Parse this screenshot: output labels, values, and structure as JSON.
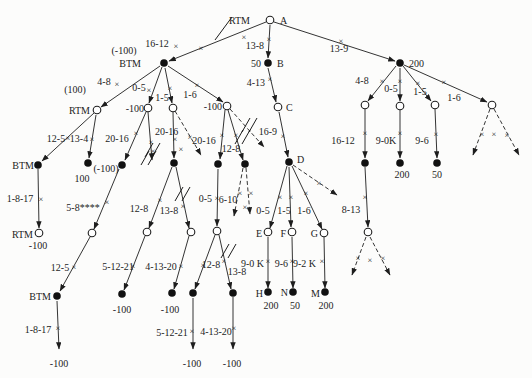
{
  "figure": {
    "name": "game-tree-search-diagram",
    "canvas": {
      "w": 532,
      "h": 378,
      "bg": "#fcfcfb",
      "ink": "#1d1d1d"
    },
    "nodes": [
      {
        "n": "A",
        "k": "o",
        "x": 270,
        "y": 20
      },
      {
        "n": "B",
        "k": "f",
        "x": 268,
        "y": 63
      },
      {
        "n": "C",
        "k": "o",
        "x": 278,
        "y": 107
      },
      {
        "n": "D",
        "k": "f",
        "x": 289,
        "y": 162
      },
      {
        "n": "BTM-1",
        "k": "f",
        "x": 164,
        "y": 63
      },
      {
        "n": "RTM-1",
        "k": "o",
        "x": 97,
        "y": 110
      },
      {
        "n": "open-148",
        "k": "o",
        "x": 148,
        "y": 108
      },
      {
        "n": "open-173",
        "k": "o",
        "x": 173,
        "y": 108
      },
      {
        "n": "open-227",
        "k": "o",
        "x": 227,
        "y": 106
      },
      {
        "n": "node-200",
        "k": "f",
        "x": 400,
        "y": 63
      },
      {
        "n": "r-open-1",
        "k": "o",
        "x": 365,
        "y": 105
      },
      {
        "n": "r-open-2",
        "k": "o",
        "x": 400,
        "y": 106
      },
      {
        "n": "r-open-3",
        "k": "o",
        "x": 435,
        "y": 105
      },
      {
        "n": "r-open-4",
        "k": "o",
        "x": 492,
        "y": 105
      },
      {
        "n": "BTM-2",
        "k": "f",
        "x": 38,
        "y": 165
      },
      {
        "n": "leaf-100",
        "k": "f",
        "x": 88,
        "y": 163
      },
      {
        "n": "mid-neg100",
        "k": "f",
        "x": 122,
        "y": 165
      },
      {
        "n": "mid-174",
        "k": "f",
        "x": 174,
        "y": 163
      },
      {
        "n": "mid-218",
        "k": "f",
        "x": 218,
        "y": 164
      },
      {
        "n": "mid-245",
        "k": "f",
        "x": 245,
        "y": 164
      },
      {
        "n": "r-fill-1",
        "k": "f",
        "x": 365,
        "y": 163
      },
      {
        "n": "r-fill-200",
        "k": "f",
        "x": 400,
        "y": 163
      },
      {
        "n": "r-fill-50",
        "k": "f",
        "x": 437,
        "y": 163
      },
      {
        "n": "RTM-2",
        "k": "o",
        "x": 39,
        "y": 233
      },
      {
        "n": "open-92",
        "k": "o",
        "x": 92,
        "y": 233
      },
      {
        "n": "open-147",
        "k": "o",
        "x": 147,
        "y": 232
      },
      {
        "n": "open-190",
        "k": "o",
        "x": 191,
        "y": 232
      },
      {
        "n": "open-217",
        "k": "o",
        "x": 217,
        "y": 231
      },
      {
        "n": "E",
        "k": "o",
        "x": 268,
        "y": 232
      },
      {
        "n": "F",
        "k": "o",
        "x": 292,
        "y": 232
      },
      {
        "n": "G",
        "k": "o",
        "x": 324,
        "y": 233
      },
      {
        "n": "open-368",
        "k": "o",
        "x": 368,
        "y": 232
      },
      {
        "n": "BTM-3",
        "k": "f",
        "x": 57,
        "y": 296
      },
      {
        "n": "leaf-neg100-a",
        "k": "f",
        "x": 122,
        "y": 294
      },
      {
        "n": "leaf-neg100-b",
        "k": "f",
        "x": 172,
        "y": 293
      },
      {
        "n": "mid-193",
        "k": "f",
        "x": 193,
        "y": 293
      },
      {
        "n": "mid-233",
        "k": "f",
        "x": 233,
        "y": 293
      },
      {
        "n": "H",
        "k": "f",
        "x": 268,
        "y": 292
      },
      {
        "n": "N",
        "k": "f",
        "x": 293,
        "y": 292
      },
      {
        "n": "M",
        "k": "f",
        "x": 325,
        "y": 292
      }
    ],
    "edges": [
      [
        266,
        22,
        169,
        61,
        0
      ],
      [
        270,
        25,
        268,
        58,
        0
      ],
      [
        274,
        22,
        395,
        61,
        0
      ],
      [
        268,
        68,
        276,
        102,
        0
      ],
      [
        279,
        112,
        288,
        157,
        0
      ],
      [
        160,
        66,
        101,
        107,
        0
      ],
      [
        162,
        67,
        149,
        103,
        0
      ],
      [
        165,
        68,
        172,
        103,
        0
      ],
      [
        168,
        66,
        223,
        102,
        0
      ],
      [
        396,
        66,
        368,
        101,
        0
      ],
      [
        400,
        68,
        400,
        101,
        0
      ],
      [
        403,
        66,
        431,
        101,
        0
      ],
      [
        404,
        65,
        487,
        102,
        0
      ],
      [
        94,
        113,
        42,
        161,
        0
      ],
      [
        96,
        115,
        89,
        158,
        0
      ],
      [
        146,
        112,
        125,
        160,
        0
      ],
      [
        148,
        112,
        152,
        160,
        0
      ],
      [
        173,
        112,
        174,
        158,
        0
      ],
      [
        175,
        111,
        201,
        155,
        1
      ],
      [
        225,
        110,
        220,
        159,
        0
      ],
      [
        228,
        110,
        243,
        160,
        0
      ],
      [
        230,
        109,
        264,
        147,
        1
      ],
      [
        119,
        169,
        94,
        229,
        0
      ],
      [
        90,
        237,
        60,
        291,
        0
      ],
      [
        38,
        169,
        39,
        228,
        0
      ],
      [
        57,
        301,
        59,
        349,
        0
      ],
      [
        172,
        167,
        149,
        228,
        0
      ],
      [
        176,
        167,
        189,
        228,
        0
      ],
      [
        218,
        169,
        217,
        226,
        0
      ],
      [
        243,
        168,
        234,
        216,
        1
      ],
      [
        246,
        168,
        250,
        214,
        1
      ],
      [
        145,
        236,
        124,
        290,
        0
      ],
      [
        189,
        236,
        174,
        289,
        0
      ],
      [
        215,
        235,
        195,
        289,
        0
      ],
      [
        219,
        235,
        231,
        289,
        0
      ],
      [
        193,
        298,
        193,
        349,
        0
      ],
      [
        233,
        297,
        233,
        349,
        0
      ],
      [
        287,
        166,
        270,
        228,
        0
      ],
      [
        289,
        167,
        291,
        227,
        0
      ],
      [
        292,
        166,
        322,
        229,
        0
      ],
      [
        293,
        165,
        337,
        195,
        1
      ],
      [
        268,
        237,
        268,
        288,
        0
      ],
      [
        292,
        237,
        293,
        288,
        0
      ],
      [
        324,
        237,
        325,
        288,
        0
      ],
      [
        365,
        109,
        365,
        158,
        0
      ],
      [
        400,
        110,
        400,
        158,
        0
      ],
      [
        435,
        109,
        437,
        158,
        0
      ],
      [
        365,
        167,
        368,
        227,
        0
      ],
      [
        490,
        109,
        473,
        155,
        1
      ],
      [
        494,
        109,
        519,
        155,
        1
      ],
      [
        366,
        237,
        352,
        275,
        1
      ],
      [
        370,
        237,
        390,
        275,
        1
      ]
    ],
    "xmarks": [
      [
        244,
        37
      ],
      [
        201,
        48
      ],
      [
        176,
        46
      ],
      [
        269,
        39
      ],
      [
        341,
        41
      ],
      [
        270,
        79
      ],
      [
        283,
        136
      ],
      [
        117,
        84
      ],
      [
        149,
        90
      ],
      [
        170,
        88
      ],
      [
        197,
        85
      ],
      [
        382,
        81
      ],
      [
        400,
        81
      ],
      [
        418,
        83
      ],
      [
        444,
        82
      ],
      [
        68,
        138
      ],
      [
        92,
        139
      ],
      [
        136,
        133
      ],
      [
        151,
        142
      ],
      [
        175,
        139
      ],
      [
        190,
        137
      ],
      [
        222,
        135
      ],
      [
        236,
        135
      ],
      [
        153,
        151
      ],
      [
        181,
        149
      ],
      [
        160,
        200
      ],
      [
        183,
        206
      ],
      [
        217,
        198
      ],
      [
        240,
        193
      ],
      [
        251,
        193
      ],
      [
        245,
        207
      ],
      [
        107,
        202
      ],
      [
        41,
        199
      ],
      [
        74,
        267
      ],
      [
        58,
        328
      ],
      [
        133,
        266
      ],
      [
        181,
        266
      ],
      [
        203,
        265
      ],
      [
        224,
        261
      ],
      [
        192,
        331
      ],
      [
        234,
        328
      ],
      [
        280,
        197
      ],
      [
        291,
        197
      ],
      [
        306,
        193
      ],
      [
        319,
        183
      ],
      [
        268,
        261
      ],
      [
        292,
        261
      ],
      [
        322,
        261
      ],
      [
        365,
        133
      ],
      [
        400,
        133
      ],
      [
        436,
        134
      ],
      [
        365,
        197
      ],
      [
        482,
        134
      ],
      [
        494,
        134
      ],
      [
        507,
        135
      ],
      [
        358,
        258
      ],
      [
        370,
        260
      ],
      [
        383,
        258
      ]
    ],
    "slashes": [
      [
        215,
        40,
        232,
        17
      ]
    ],
    "dslashes": [
      [
        150,
        150
      ],
      [
        146,
        158
      ],
      [
        247,
        125
      ],
      [
        240,
        137
      ],
      [
        180,
        194
      ],
      [
        226,
        251
      ]
    ],
    "labels": [
      {
        "t": "RTM",
        "x": 250,
        "y": 24,
        "a": "end"
      },
      {
        "t": "A",
        "x": 280,
        "y": 24,
        "a": "start"
      },
      {
        "t": "13-8",
        "x": 264,
        "y": 49,
        "a": "end"
      },
      {
        "t": "50",
        "x": 261,
        "y": 67,
        "a": "end"
      },
      {
        "t": "B",
        "x": 277,
        "y": 67,
        "a": "start"
      },
      {
        "t": "13-9",
        "x": 339,
        "y": 52,
        "a": "middle"
      },
      {
        "t": "200",
        "x": 409,
        "y": 67,
        "a": "start"
      },
      {
        "t": "(-100)",
        "x": 124,
        "y": 54,
        "a": "middle"
      },
      {
        "t": "BTM",
        "x": 141,
        "y": 67,
        "a": "end"
      },
      {
        "t": "16-12",
        "x": 157,
        "y": 47,
        "a": "middle"
      },
      {
        "t": "4-8",
        "x": 104,
        "y": 85,
        "a": "middle"
      },
      {
        "t": "0-5",
        "x": 139,
        "y": 91,
        "a": "middle"
      },
      {
        "t": "1-5",
        "x": 162,
        "y": 101,
        "a": "middle"
      },
      {
        "t": "1-6",
        "x": 190,
        "y": 98,
        "a": "middle"
      },
      {
        "t": "(100)",
        "x": 75,
        "y": 93,
        "a": "middle"
      },
      {
        "t": "RTM",
        "x": 90,
        "y": 114,
        "a": "end"
      },
      {
        "t": "-100",
        "x": 144,
        "y": 112,
        "a": "end"
      },
      {
        "t": "-100",
        "x": 222,
        "y": 110,
        "a": "end"
      },
      {
        "t": "4-13",
        "x": 265,
        "y": 86,
        "a": "end"
      },
      {
        "t": "C",
        "x": 286,
        "y": 111,
        "a": "start"
      },
      {
        "t": "16-9",
        "x": 277,
        "y": 135,
        "a": "end"
      },
      {
        "t": "4-8",
        "x": 362,
        "y": 84,
        "a": "middle"
      },
      {
        "t": "0-5",
        "x": 391,
        "y": 92,
        "a": "middle"
      },
      {
        "t": "1-5",
        "x": 420,
        "y": 95,
        "a": "middle"
      },
      {
        "t": "1-6",
        "x": 454,
        "y": 101,
        "a": "middle"
      },
      {
        "t": "12-5",
        "x": 56,
        "y": 142,
        "a": "middle"
      },
      {
        "t": "13-4",
        "x": 79,
        "y": 142,
        "a": "middle"
      },
      {
        "t": "20-16",
        "x": 117,
        "y": 142,
        "a": "middle"
      },
      {
        "t": "20-16",
        "x": 155,
        "y": 135,
        "a": "start"
      },
      {
        "t": "20-16",
        "x": 204,
        "y": 144,
        "a": "middle"
      },
      {
        "t": "12-8",
        "x": 231,
        "y": 152,
        "a": "middle"
      },
      {
        "t": "16-12",
        "x": 343,
        "y": 144,
        "a": "middle"
      },
      {
        "t": "9-0K",
        "x": 386,
        "y": 144,
        "a": "middle"
      },
      {
        "t": "9-6",
        "x": 422,
        "y": 144,
        "a": "middle"
      },
      {
        "t": "100",
        "x": 82,
        "y": 182,
        "a": "middle"
      },
      {
        "t": "(-100)",
        "x": 106,
        "y": 172,
        "a": "middle"
      },
      {
        "t": "5-8****",
        "x": 83,
        "y": 211,
        "a": "middle"
      },
      {
        "t": "12-8",
        "x": 139,
        "y": 212,
        "a": "middle"
      },
      {
        "t": "13-8",
        "x": 169,
        "y": 214,
        "a": "middle"
      },
      {
        "t": "0-5",
        "x": 212,
        "y": 202,
        "a": "end"
      },
      {
        "t": "6-10",
        "x": 228,
        "y": 203,
        "a": "middle"
      },
      {
        "t": "D",
        "x": 297,
        "y": 163,
        "a": "start"
      },
      {
        "t": "0-5",
        "x": 263,
        "y": 214,
        "a": "middle"
      },
      {
        "t": "1-5",
        "x": 284,
        "y": 214,
        "a": "middle"
      },
      {
        "t": "1-6",
        "x": 304,
        "y": 214,
        "a": "middle"
      },
      {
        "t": "8-13",
        "x": 351,
        "y": 213,
        "a": "middle"
      },
      {
        "t": "E",
        "x": 262,
        "y": 237,
        "a": "end"
      },
      {
        "t": "F",
        "x": 286,
        "y": 237,
        "a": "end"
      },
      {
        "t": "G",
        "x": 318,
        "y": 237,
        "a": "end"
      },
      {
        "t": "BTM",
        "x": 34,
        "y": 169,
        "a": "end"
      },
      {
        "t": "1-8-17",
        "x": 20,
        "y": 202,
        "a": "middle"
      },
      {
        "t": "RTM",
        "x": 33,
        "y": 238,
        "a": "end"
      },
      {
        "t": "-100",
        "x": 38,
        "y": 249,
        "a": "middle"
      },
      {
        "t": "12-5",
        "x": 60,
        "y": 271,
        "a": "middle"
      },
      {
        "t": "BTM",
        "x": 51,
        "y": 300,
        "a": "end"
      },
      {
        "t": "1-8-17",
        "x": 38,
        "y": 333,
        "a": "middle"
      },
      {
        "t": "-100",
        "x": 59,
        "y": 367,
        "a": "middle"
      },
      {
        "t": "5-12-21",
        "x": 118,
        "y": 270,
        "a": "middle"
      },
      {
        "t": "4-13-20",
        "x": 161,
        "y": 270,
        "a": "middle"
      },
      {
        "t": "12-8",
        "x": 211,
        "y": 268,
        "a": "middle"
      },
      {
        "t": "13-8",
        "x": 237,
        "y": 275,
        "a": "middle"
      },
      {
        "t": "-100",
        "x": 122,
        "y": 313,
        "a": "middle"
      },
      {
        "t": "-100",
        "x": 170,
        "y": 313,
        "a": "middle"
      },
      {
        "t": "5-12-21",
        "x": 172,
        "y": 336,
        "a": "middle"
      },
      {
        "t": "4-13-20",
        "x": 216,
        "y": 335,
        "a": "middle"
      },
      {
        "t": "-100",
        "x": 192,
        "y": 367,
        "a": "middle"
      },
      {
        "t": "-100",
        "x": 232,
        "y": 367,
        "a": "middle"
      },
      {
        "t": "9-0 K",
        "x": 264,
        "y": 267,
        "a": "end"
      },
      {
        "t": "9-6",
        "x": 288,
        "y": 267,
        "a": "end"
      },
      {
        "t": "9-2 K",
        "x": 316,
        "y": 267,
        "a": "end"
      },
      {
        "t": "H",
        "x": 263,
        "y": 297,
        "a": "end"
      },
      {
        "t": "200",
        "x": 271,
        "y": 309,
        "a": "middle"
      },
      {
        "t": "N",
        "x": 288,
        "y": 296,
        "a": "end"
      },
      {
        "t": "50",
        "x": 295,
        "y": 309,
        "a": "middle"
      },
      {
        "t": "M",
        "x": 320,
        "y": 297,
        "a": "end"
      },
      {
        "t": "200",
        "x": 326,
        "y": 309,
        "a": "middle"
      },
      {
        "t": "200",
        "x": 402,
        "y": 178,
        "a": "middle"
      },
      {
        "t": "50",
        "x": 437,
        "y": 178,
        "a": "middle"
      }
    ]
  }
}
